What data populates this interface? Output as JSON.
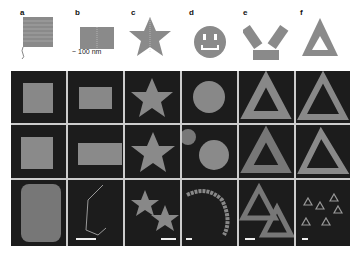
{
  "figure": {
    "panels": [
      {
        "label": "a",
        "shape": "square"
      },
      {
        "label": "b",
        "shape": "rectangle",
        "scale_annotation": "~ 100 nm"
      },
      {
        "label": "c",
        "shape": "star"
      },
      {
        "label": "d",
        "shape": "smiley face"
      },
      {
        "label": "e",
        "shape": "three-hole disk / triangle of rectangles"
      },
      {
        "label": "f",
        "shape": "sharp triangle"
      }
    ],
    "rows": [
      "schematic",
      "AFM zoom",
      "AFM zoom 2",
      "AFM overview with scale bars"
    ],
    "colors": {
      "schematic_fill": "#8a8a8a",
      "afm_background": "#1c1c1c",
      "afm_shape": "#9a9a9a",
      "grid_line": "#cccccc"
    }
  }
}
